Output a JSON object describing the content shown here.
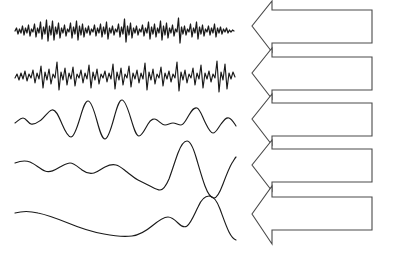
{
  "figure": {
    "width": 395,
    "height": 253,
    "background_color": "#ffffff",
    "wave_stroke_color": "#1a1a1a",
    "arrow_stroke_color": "#4a4a4a",
    "arrow_fill_color": "#ffffff",
    "label_text_color": "#1c1c1c"
  },
  "bands": [
    {
      "id": "gamma",
      "label": "Gamma(>30Hz)",
      "name": "Gamma",
      "range_text": ">30Hz",
      "freq_min_hz": 30,
      "freq_max_hz": null,
      "wave_description": "very high frequency dense low-amplitude oscillations"
    },
    {
      "id": "beta",
      "label": "Beta(12~30Hz)",
      "name": "Beta",
      "range_text": "12~30Hz",
      "freq_min_hz": 12,
      "freq_max_hz": 30,
      "wave_description": "high frequency moderate-amplitude oscillations"
    },
    {
      "id": "alpha",
      "label": "Alpha(8~12Hz)",
      "name": "Alpha",
      "range_text": "8~12Hz",
      "freq_min_hz": 8,
      "freq_max_hz": 12,
      "wave_description": "smooth rounded oscillations with central spindle burst"
    },
    {
      "id": "theta",
      "label": "Theta(4~8Hz)",
      "name": "Theta",
      "range_text": "4~8Hz",
      "freq_min_hz": 4,
      "freq_max_hz": 8,
      "wave_description": "slow small ripples followed by large slow deflections"
    },
    {
      "id": "delta",
      "label": "Delta(0.1~4Hz)",
      "name": "Delta",
      "range_text": "0.1~4Hz",
      "freq_min_hz": 0.1,
      "freq_max_hz": 4,
      "wave_description": "very slow single broad high-amplitude hump"
    }
  ]
}
